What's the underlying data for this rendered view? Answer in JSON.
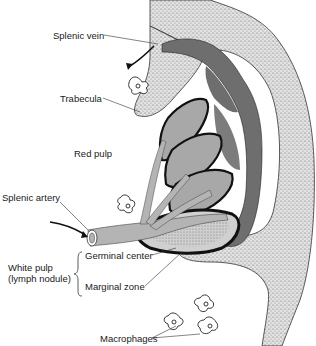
{
  "diagram": {
    "labels": {
      "splenic_vein": "Splenic vein",
      "trabecula": "Trabecula",
      "red_pulp": "Red pulp",
      "splenic_artery": "Splenic artery",
      "white_pulp_line1": "White pulp",
      "white_pulp_line2": "(lymph nodule)",
      "germinal_center": "Germinal center",
      "marginal_zone": "Marginal zone",
      "macrophages": "Macrophages"
    },
    "colors": {
      "capsule_stipple": "#d6d6d6",
      "vein": "#6e6e6e",
      "artery": "#b4b4b4",
      "sinus_light": "#a8a8a8",
      "marginal_black": "#111111",
      "outline": "#333333"
    }
  }
}
